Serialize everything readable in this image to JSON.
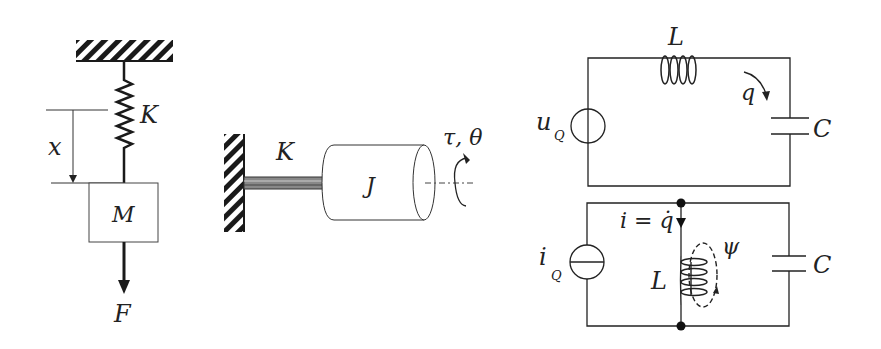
{
  "diagram": {
    "panels": [
      {
        "id": "mass-spring",
        "labels": {
          "spring": "K",
          "displacement": "x",
          "mass": "M",
          "force": "F"
        }
      },
      {
        "id": "torsion-pendulum",
        "labels": {
          "spring": "K",
          "inertia": "J",
          "torque_angle": "τ, θ"
        }
      },
      {
        "id": "series-lc",
        "labels": {
          "inductor": "L",
          "charge": "q",
          "source": "u",
          "source_sub": "Q",
          "capacitor": "C"
        }
      },
      {
        "id": "parallel-lc",
        "labels": {
          "current": "i = q̇",
          "current_i": "i",
          "current_eq": "=",
          "current_q": "q",
          "flux": "ψ",
          "inductor": "L",
          "source": "i",
          "source_sub": "Q",
          "capacitor": "C"
        }
      }
    ]
  },
  "colors": {
    "stroke": "#1a1a1a",
    "background": "#ffffff",
    "thin": "#333333"
  }
}
